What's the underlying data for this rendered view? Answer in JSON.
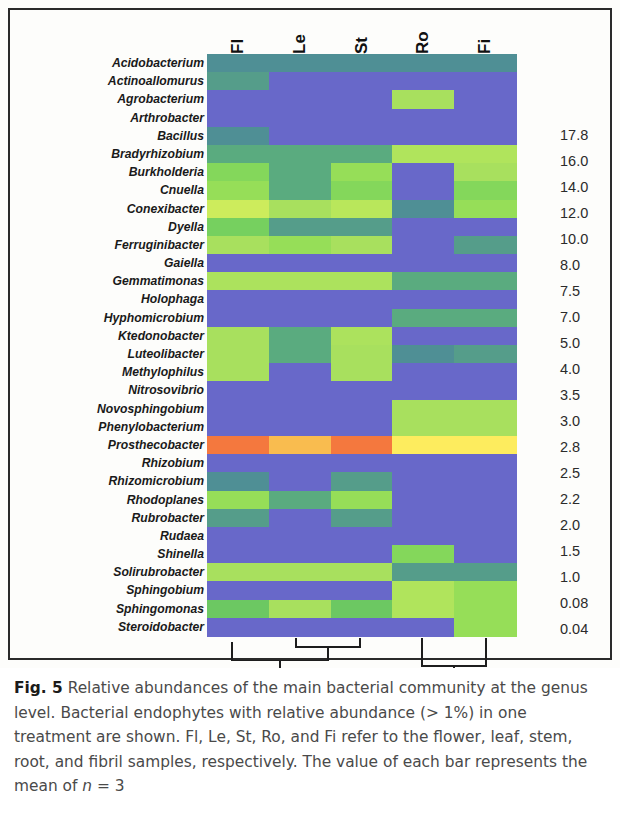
{
  "figure": {
    "label": "Fig. 5",
    "caption_part1": "Relative abundances of the main bacterial community at the genus level. Bacterial endophytes with relative abundance (> 1%) in one treatment are shown. Fl, Le, St, Ro, and Fi refer to the flower, leaf, stem, root, and fibril samples, respectively. The value of each bar represents the mean of ",
    "caption_n": "n",
    "caption_part2": " = 3"
  },
  "colorbar": {
    "name": "relative-abundance-scale",
    "ticks": [
      "17.8",
      "16.0",
      "14.0",
      "12.0",
      "10.0",
      "8.0",
      "7.5",
      "7.0",
      "5.0",
      "4.0",
      "3.5",
      "3.0",
      "2.8",
      "2.5",
      "2.2",
      "2.0",
      "1.5",
      "1.0",
      "0.08",
      "0.04"
    ],
    "max": 17.8,
    "min": 0.04,
    "high_color": "#f4713b",
    "mid_color": "#fdf35f",
    "low_color": "#6a6ccb"
  },
  "chart_data": {
    "type": "heatmap",
    "title": "Relative abundances of the main bacterial community at the genus level",
    "xlabel": "",
    "ylabel": "",
    "grid": false,
    "legend_position": "right",
    "columns": [
      "Fl",
      "Le",
      "St",
      "Ro",
      "Fi"
    ],
    "column_full_names": [
      "flower",
      "leaf",
      "stem",
      "root",
      "fibril"
    ],
    "rows": [
      "Acidobacterium",
      "Actinoallomurus",
      "Agrobacterium",
      "Arthrobacter",
      "Bacillus",
      "Bradyrhizobium",
      "Burkholderia",
      "Cnuella",
      "Conexibacter",
      "Dyella",
      "Ferruginibacter",
      "Gaiella",
      "Gemmatimonas",
      "Holophaga",
      "Hyphomicrobium",
      "Ktedonobacter",
      "Luteolibacter",
      "Methylophilus",
      "Nitrosovibrio",
      "Novosphingobium",
      "Phenylobacterium",
      "Prosthecobacter",
      "Rhizobium",
      "Rhizomicrobium",
      "Rhodoplanes",
      "Rubrobacter",
      "Rudaea",
      "Shinella",
      "Solirubrobacter",
      "Sphingobium",
      "Sphingomonas",
      "Steroidobacter"
    ],
    "zlabel": "Relative abundance (%)",
    "zlim": [
      0.04,
      17.8
    ],
    "values": [
      [
        1.8,
        1.8,
        1.8,
        1.8,
        1.8
      ],
      [
        1.9,
        1.0,
        1.0,
        1.0,
        1.0
      ],
      [
        1.0,
        1.0,
        1.0,
        3.0,
        1.0
      ],
      [
        1.0,
        1.0,
        1.0,
        1.0,
        1.0
      ],
      [
        1.8,
        1.0,
        1.0,
        1.0,
        1.0
      ],
      [
        2.0,
        2.0,
        2.0,
        3.2,
        3.2
      ],
      [
        2.6,
        2.0,
        2.8,
        1.0,
        3.0
      ],
      [
        2.8,
        2.0,
        2.6,
        1.0,
        2.6
      ],
      [
        4.0,
        3.0,
        3.4,
        1.8,
        2.8
      ],
      [
        2.4,
        1.9,
        1.9,
        1.0,
        1.0
      ],
      [
        3.0,
        2.8,
        3.0,
        1.0,
        1.9
      ],
      [
        1.0,
        1.0,
        1.0,
        1.0,
        1.0
      ],
      [
        3.1,
        3.1,
        3.1,
        2.0,
        2.0
      ],
      [
        1.0,
        1.0,
        1.0,
        1.0,
        1.0
      ],
      [
        1.0,
        1.0,
        1.0,
        2.0,
        2.0
      ],
      [
        3.0,
        2.0,
        3.1,
        1.0,
        1.0
      ],
      [
        3.0,
        2.0,
        3.0,
        1.8,
        1.9
      ],
      [
        3.0,
        1.0,
        3.0,
        1.0,
        1.0
      ],
      [
        1.0,
        1.0,
        1.0,
        1.0,
        1.0
      ],
      [
        1.0,
        1.0,
        1.0,
        3.0,
        3.0
      ],
      [
        1.0,
        1.0,
        1.0,
        3.0,
        3.0
      ],
      [
        17.0,
        11.5,
        17.0,
        8.0,
        8.0
      ],
      [
        1.0,
        1.0,
        1.0,
        1.0,
        1.0
      ],
      [
        1.8,
        1.0,
        1.9,
        1.0,
        1.0
      ],
      [
        2.8,
        2.0,
        2.8,
        1.0,
        1.0
      ],
      [
        1.9,
        1.0,
        1.9,
        1.0,
        1.0
      ],
      [
        1.0,
        1.0,
        1.0,
        1.0,
        1.0
      ],
      [
        1.0,
        1.0,
        1.0,
        2.6,
        1.0
      ],
      [
        3.0,
        3.0,
        3.0,
        1.9,
        1.9
      ],
      [
        1.0,
        1.0,
        1.0,
        3.2,
        2.8
      ],
      [
        2.2,
        3.0,
        2.2,
        3.2,
        2.8
      ],
      [
        1.0,
        1.0,
        1.0,
        1.0,
        2.8
      ]
    ]
  },
  "dendrogram": {
    "name": "column-clustering-dendrogram",
    "description": "Fl groups with (Le, St); Ro groups with Fi"
  }
}
